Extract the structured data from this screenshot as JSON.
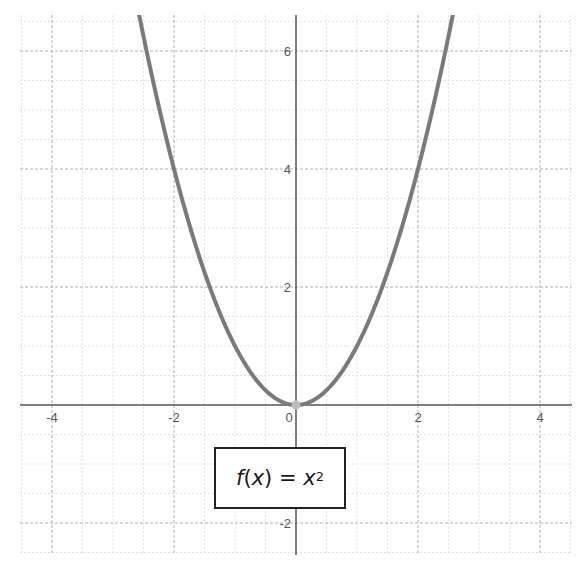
{
  "chart_data": {
    "type": "line",
    "title": "",
    "function": "f(x) = x^2",
    "legend": {
      "label_fn": "f",
      "label_var": "x",
      "label_eq": "=",
      "label_rhs_var": "x",
      "label_exp": "2",
      "position": "inside-bottom-center"
    },
    "series": [
      {
        "name": "f(x) = x^2",
        "color": "#7a7a7a",
        "x": [
          -2.6,
          -2.5,
          -2.25,
          -2,
          -1.75,
          -1.5,
          -1.25,
          -1,
          -0.75,
          -0.5,
          -0.25,
          0,
          0.25,
          0.5,
          0.75,
          1,
          1.25,
          1.5,
          1.75,
          2,
          2.25,
          2.5,
          2.6
        ],
        "y": [
          6.76,
          6.25,
          5.0625,
          4,
          3.0625,
          2.25,
          1.5625,
          1,
          0.5625,
          0.25,
          0.0625,
          0,
          0.0625,
          0.25,
          0.5625,
          1,
          1.5625,
          2.25,
          3.0625,
          4,
          5.0625,
          6.25,
          6.76
        ]
      }
    ],
    "points": [
      {
        "name": "vertex",
        "x": 0,
        "y": 0,
        "color": "#bdbdbd"
      }
    ],
    "xlabel": "",
    "ylabel": "",
    "xlim": [
      -4.5,
      4.5
    ],
    "ylim": [
      -2.5,
      6.6
    ],
    "x_ticks": [
      -4,
      -2,
      0,
      2,
      4
    ],
    "x_tick_labels": [
      "-4",
      "-2",
      "0",
      "2",
      "4"
    ],
    "y_ticks": [
      -2,
      2,
      4,
      6
    ],
    "y_tick_labels": [
      "-2",
      "2",
      "4",
      "6"
    ],
    "grid": {
      "major": true,
      "minor": true,
      "major_step": 2,
      "minor_step": 0.5
    }
  },
  "colors": {
    "axis": "#555555",
    "major_grid": "#b0b0b0",
    "minor_grid": "#e2e2e2",
    "curve": "#7a7a7a",
    "vertex": "#bdbdbd"
  }
}
